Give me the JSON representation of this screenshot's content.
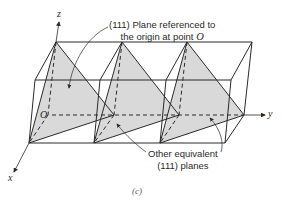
{
  "figure": {
    "caption": "(c)",
    "axes": {
      "x": "x",
      "y": "y",
      "z": "z",
      "origin": "O"
    },
    "callouts": {
      "top": {
        "line1": "(111) Plane referenced to",
        "line2_prefix": "the origin at point ",
        "line2_var": "O"
      },
      "bottom": {
        "line1": "Other equivalent",
        "line2": "(111) planes"
      }
    },
    "colors": {
      "line": "#2a2a2a",
      "plane_fill": "#d8d8d8",
      "background": "#ffffff"
    }
  }
}
